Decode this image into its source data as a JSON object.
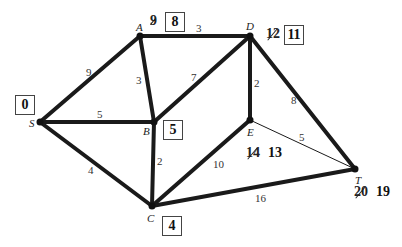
{
  "nodes": [
    {
      "id": "S",
      "x": 40,
      "y": 122
    },
    {
      "id": "A",
      "x": 140,
      "y": 36
    },
    {
      "id": "D",
      "x": 250,
      "y": 36
    },
    {
      "id": "B",
      "x": 154,
      "y": 122
    },
    {
      "id": "E",
      "x": 250,
      "y": 120
    },
    {
      "id": "C",
      "x": 152,
      "y": 206
    },
    {
      "id": "T",
      "x": 355,
      "y": 169
    }
  ],
  "edges": [
    {
      "from": "S",
      "to": "A",
      "weight": "9",
      "bold": true
    },
    {
      "from": "S",
      "to": "B",
      "weight": "5",
      "bold": true
    },
    {
      "from": "S",
      "to": "C",
      "weight": "4",
      "bold": true
    },
    {
      "from": "A",
      "to": "D",
      "weight": "3",
      "bold": true
    },
    {
      "from": "A",
      "to": "B",
      "weight": "3",
      "bold": true
    },
    {
      "from": "B",
      "to": "D",
      "weight": "7",
      "bold": true
    },
    {
      "from": "B",
      "to": "C",
      "weight": "2",
      "bold": true
    },
    {
      "from": "D",
      "to": "E",
      "weight": "2",
      "bold": true
    },
    {
      "from": "D",
      "to": "T",
      "weight": "8",
      "bold": true
    },
    {
      "from": "E",
      "to": "T",
      "weight": "5",
      "bold": false
    },
    {
      "from": "C",
      "to": "E",
      "weight": "10",
      "bold": true
    },
    {
      "from": "C",
      "to": "T",
      "weight": "16",
      "bold": true
    }
  ],
  "labels": {
    "S": {
      "final": "0"
    },
    "A": {
      "old": "9",
      "final": "8"
    },
    "D": {
      "old": "12",
      "final": "11"
    },
    "B": {
      "final": "5"
    },
    "E": {
      "old": "14",
      "final": "13"
    },
    "C": {
      "final": "4"
    },
    "T": {
      "old": "20",
      "final": "19"
    }
  }
}
